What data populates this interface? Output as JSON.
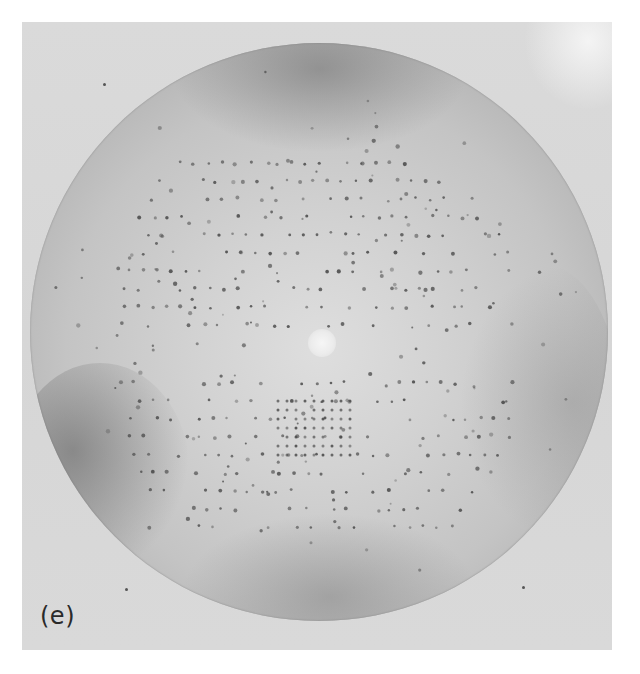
{
  "figure": {
    "panel_label": "(e)",
    "colors": {
      "page_background": "#ffffff",
      "panel_background": "#d8d8d8",
      "film_center": "#dedede",
      "film_edge": "#9d9d9d",
      "beamstop": "#f4f4f4",
      "spot": "#4a4a4a",
      "label": "#2a2a2a"
    },
    "film": {
      "center_x": 297,
      "center_y": 311,
      "radius": 289
    },
    "lattice_rows": [
      {
        "y": 120,
        "x_start": 150,
        "x_end": 430,
        "step": 14
      },
      {
        "y": 138,
        "x_start": 130,
        "x_end": 450,
        "step": 14
      },
      {
        "y": 156,
        "x_start": 120,
        "x_end": 460,
        "step": 14
      },
      {
        "y": 174,
        "x_start": 110,
        "x_end": 470,
        "step": 14
      },
      {
        "y": 192,
        "x_start": 105,
        "x_end": 475,
        "step": 14
      },
      {
        "y": 210,
        "x_start": 100,
        "x_end": 480,
        "step": 14
      },
      {
        "y": 228,
        "x_start": 100,
        "x_end": 480,
        "step": 14
      },
      {
        "y": 246,
        "x_start": 95,
        "x_end": 485,
        "step": 14
      },
      {
        "y": 264,
        "x_start": 95,
        "x_end": 485,
        "step": 14
      },
      {
        "y": 282,
        "x_start": 90,
        "x_end": 490,
        "step": 14
      },
      {
        "y": 340,
        "x_start": 90,
        "x_end": 490,
        "step": 14
      },
      {
        "y": 358,
        "x_start": 95,
        "x_end": 485,
        "step": 14
      },
      {
        "y": 376,
        "x_start": 100,
        "x_end": 480,
        "step": 14
      },
      {
        "y": 394,
        "x_start": 100,
        "x_end": 480,
        "step": 14
      },
      {
        "y": 412,
        "x_start": 105,
        "x_end": 475,
        "step": 14
      },
      {
        "y": 430,
        "x_start": 110,
        "x_end": 470,
        "step": 14
      },
      {
        "y": 448,
        "x_start": 120,
        "x_end": 460,
        "step": 14
      },
      {
        "y": 466,
        "x_start": 135,
        "x_end": 445,
        "step": 14
      },
      {
        "y": 484,
        "x_start": 155,
        "x_end": 425,
        "step": 14
      }
    ],
    "dense_cluster": {
      "x": 248,
      "y": 358,
      "cols": 9,
      "rows": 7,
      "step": 9
    },
    "stray_spots": [
      {
        "x": 103,
        "y": 83
      },
      {
        "x": 125,
        "y": 588
      },
      {
        "x": 522,
        "y": 586
      }
    ]
  }
}
